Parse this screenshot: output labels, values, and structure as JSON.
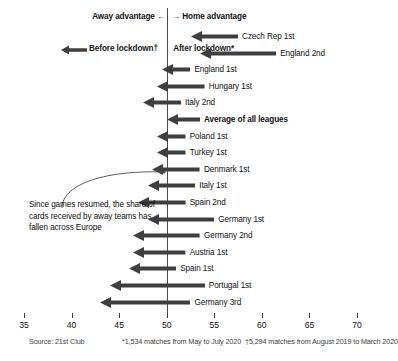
{
  "header": {
    "away_advantage": "Away advantage ←",
    "home_advantage": "→ Home advantage"
  },
  "legend": {
    "after_label": "After lockdown*",
    "before_label": "Before lockdown†",
    "arrow_icon": "left-arrow-icon"
  },
  "annotation": {
    "text": "Since games resumed, the share of cards received by away teams has fallen across Europe"
  },
  "footer": {
    "source": "Source: 21st Club",
    "note_after": "*1,534 matches from May to July 2020",
    "note_before": "†5,294 matches from August 2019 to March 2020"
  },
  "colors": {
    "arrow": "#3f3f3f",
    "axis": "#4b4b4b",
    "text": "#111111"
  },
  "chart_data": {
    "type": "bar",
    "title": "",
    "subtitle": "",
    "xlabel": "Share of cards received by away teams (%)",
    "ylabel": "",
    "xlim": [
      35,
      70
    ],
    "grid": false,
    "legend_position": "top-left",
    "zero_reference": 50,
    "xticks": [
      35,
      40,
      45,
      50,
      55,
      60,
      65,
      70
    ],
    "xticklabels": [
      "35",
      "40",
      "45",
      "50",
      "55",
      "60",
      "65",
      "70"
    ],
    "series": [
      {
        "name": "Before lockdown†",
        "note": "arrow tail = value before lockdown"
      },
      {
        "name": "After lockdown*",
        "note": "arrow head = value after lockdown"
      }
    ],
    "categories": [
      "Czech Rep 1st",
      "England 2nd",
      "England 1st",
      "Hungary 1st",
      "Italy 2nd",
      "Average of all leagues",
      "Poland 1st",
      "Turkey 1st",
      "Denmark 1st",
      "Italy 1st",
      "Spain 2nd",
      "Germany 1st",
      "Germany 2nd",
      "Austria 1st",
      "Spain 1st",
      "Portugal 1st",
      "Germany 3rd"
    ],
    "points": [
      {
        "label": "Czech Rep 1st",
        "before": 57.5,
        "after": 52.5,
        "bold": false
      },
      {
        "label": "England 2nd",
        "before": 61.5,
        "after": 53.5,
        "bold": false
      },
      {
        "label": "England 1st",
        "before": 52.5,
        "after": 49.5,
        "bold": false
      },
      {
        "label": "Hungary 1st",
        "before": 54.0,
        "after": 49.0,
        "bold": false
      },
      {
        "label": "Italy 2nd",
        "before": 51.5,
        "after": 47.5,
        "bold": false
      },
      {
        "label": "Average of all leagues",
        "before": 53.5,
        "after": 50.0,
        "bold": true
      },
      {
        "label": "Poland 1st",
        "before": 52.0,
        "after": 49.0,
        "bold": false
      },
      {
        "label": "Turkey 1st",
        "before": 52.0,
        "after": 49.0,
        "bold": false
      },
      {
        "label": "Denmark 1st",
        "before": 53.5,
        "after": 48.5,
        "bold": false
      },
      {
        "label": "Italy 1st",
        "before": 53.0,
        "after": 48.0,
        "bold": false
      },
      {
        "label": "Spain 2nd",
        "before": 52.0,
        "after": 47.0,
        "bold": false
      },
      {
        "label": "Germany 1st",
        "before": 55.0,
        "after": 48.0,
        "bold": false
      },
      {
        "label": "Germany 2nd",
        "before": 53.5,
        "after": 46.5,
        "bold": false
      },
      {
        "label": "Austria 1st",
        "before": 52.0,
        "after": 46.5,
        "bold": false
      },
      {
        "label": "Spain 1st",
        "before": 51.0,
        "after": 46.0,
        "bold": false
      },
      {
        "label": "Portugal 1st",
        "before": 54.0,
        "after": 44.0,
        "bold": false
      },
      {
        "label": "Germany 3rd",
        "before": 52.5,
        "after": 43.0,
        "bold": false
      }
    ]
  }
}
